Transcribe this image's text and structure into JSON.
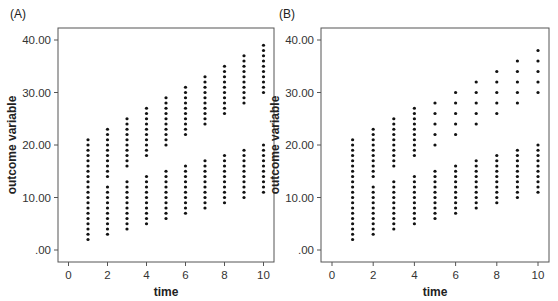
{
  "chart_data": [
    {
      "type": "scatter",
      "panel_label": "(A)",
      "title": "",
      "xlabel": "time",
      "ylabel": "outcome variable",
      "xlim": [
        -0.5,
        10.5
      ],
      "ylim": [
        -2,
        42
      ],
      "xticks": [
        0,
        2,
        4,
        6,
        8,
        10
      ],
      "xtick_labels": [
        "0",
        "2",
        "4",
        "6",
        "8",
        "10"
      ],
      "yticks": [
        0,
        10,
        20,
        30,
        40
      ],
      "ytick_labels": [
        ".00",
        "10.00",
        "20.00",
        "30.00",
        "40.00"
      ],
      "grid": false,
      "series": [
        {
          "name": "lower group",
          "columns": [
            {
              "x": 1,
              "ymin": 2,
              "ymax": 12,
              "step": 1
            },
            {
              "x": 2,
              "ymin": 3,
              "ymax": 12,
              "step": 1
            },
            {
              "x": 3,
              "ymin": 4,
              "ymax": 13,
              "step": 1
            },
            {
              "x": 4,
              "ymin": 5,
              "ymax": 14,
              "step": 1
            },
            {
              "x": 5,
              "ymin": 6,
              "ymax": 15,
              "step": 1
            },
            {
              "x": 6,
              "ymin": 7,
              "ymax": 16,
              "step": 1
            },
            {
              "x": 7,
              "ymin": 8,
              "ymax": 17,
              "step": 1
            },
            {
              "x": 8,
              "ymin": 9,
              "ymax": 18,
              "step": 1
            },
            {
              "x": 9,
              "ymin": 10,
              "ymax": 19,
              "step": 1
            },
            {
              "x": 10,
              "ymin": 11,
              "ymax": 20,
              "step": 1
            }
          ]
        },
        {
          "name": "upper group",
          "columns": [
            {
              "x": 1,
              "ymin": 13,
              "ymax": 21,
              "step": 1
            },
            {
              "x": 2,
              "ymin": 14,
              "ymax": 23,
              "step": 1
            },
            {
              "x": 3,
              "ymin": 16,
              "ymax": 25,
              "step": 1
            },
            {
              "x": 4,
              "ymin": 18,
              "ymax": 27,
              "step": 1
            },
            {
              "x": 5,
              "ymin": 20,
              "ymax": 29,
              "step": 1
            },
            {
              "x": 6,
              "ymin": 22,
              "ymax": 31,
              "step": 1
            },
            {
              "x": 7,
              "ymin": 24,
              "ymax": 33,
              "step": 1
            },
            {
              "x": 8,
              "ymin": 26,
              "ymax": 35,
              "step": 1
            },
            {
              "x": 9,
              "ymin": 28,
              "ymax": 37,
              "step": 1
            },
            {
              "x": 10,
              "ymin": 30,
              "ymax": 39,
              "step": 1
            }
          ]
        }
      ]
    },
    {
      "type": "scatter",
      "panel_label": "(B)",
      "title": "",
      "xlabel": "time",
      "ylabel": "outcome variable",
      "xlim": [
        -0.5,
        10.5
      ],
      "ylim": [
        -2,
        42
      ],
      "xticks": [
        0,
        2,
        4,
        6,
        8,
        10
      ],
      "xtick_labels": [
        "0",
        "2",
        "4",
        "6",
        "8",
        "10"
      ],
      "yticks": [
        0,
        10,
        20,
        30,
        40
      ],
      "ytick_labels": [
        ".00",
        "10.00",
        "20.00",
        "30.00",
        "40.00"
      ],
      "grid": false,
      "series": [
        {
          "name": "lower group",
          "columns": [
            {
              "x": 1,
              "ymin": 2,
              "ymax": 12,
              "step": 1
            },
            {
              "x": 2,
              "ymin": 3,
              "ymax": 12,
              "step": 1
            },
            {
              "x": 3,
              "ymin": 4,
              "ymax": 13,
              "step": 1
            },
            {
              "x": 4,
              "ymin": 5,
              "ymax": 14,
              "step": 1
            },
            {
              "x": 5,
              "ymin": 6,
              "ymax": 15,
              "step": 1
            },
            {
              "x": 6,
              "ymin": 7,
              "ymax": 16,
              "step": 1
            },
            {
              "x": 7,
              "ymin": 8,
              "ymax": 17,
              "step": 1
            },
            {
              "x": 8,
              "ymin": 9,
              "ymax": 18,
              "step": 1
            },
            {
              "x": 9,
              "ymin": 10,
              "ymax": 19,
              "step": 1
            },
            {
              "x": 10,
              "ymin": 11,
              "ymax": 20,
              "step": 1
            }
          ]
        },
        {
          "name": "upper group",
          "columns": [
            {
              "x": 1,
              "ymin": 13,
              "ymax": 21,
              "step": 1
            },
            {
              "x": 2,
              "ymin": 14,
              "ymax": 23,
              "step": 1
            },
            {
              "x": 3,
              "ymin": 16,
              "ymax": 25,
              "step": 1
            },
            {
              "x": 4,
              "ymin": 18,
              "ymax": 27,
              "step": 1
            },
            {
              "x": 5,
              "ymin": 20,
              "ymax": 28,
              "step": 2
            },
            {
              "x": 6,
              "ymin": 22,
              "ymax": 30,
              "step": 2
            },
            {
              "x": 7,
              "ymin": 24,
              "ymax": 32,
              "step": 2
            },
            {
              "x": 8,
              "ymin": 26,
              "ymax": 34,
              "step": 2
            },
            {
              "x": 9,
              "ymin": 28,
              "ymax": 36,
              "step": 2
            },
            {
              "x": 10,
              "ymin": 30,
              "ymax": 38,
              "step": 2
            }
          ]
        }
      ]
    }
  ],
  "layout": {
    "panels": [
      {
        "frame": {
          "x": 58,
          "y": 28,
          "w": 216,
          "h": 234
        },
        "x0px": 68.5,
        "xscale": 19.5,
        "y0px": 250,
        "yscale": 5.25,
        "label_pos": {
          "x": 10,
          "y": 18
        }
      },
      {
        "frame": {
          "x": 321,
          "y": 28,
          "w": 228,
          "h": 234
        },
        "x0px": 332,
        "xscale": 20.6,
        "y0px": 250,
        "yscale": 5.25,
        "label_pos": {
          "x": 279,
          "y": 18
        }
      }
    ]
  }
}
